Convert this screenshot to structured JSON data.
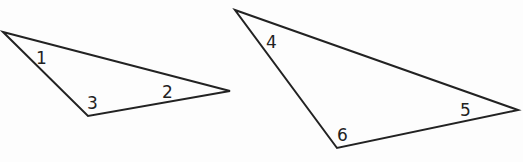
{
  "diagram": {
    "stroke_color": "#222222",
    "triangles": [
      {
        "name": "triangle-left",
        "points": [
          [
            3,
            32
          ],
          [
            230,
            91
          ],
          [
            88,
            116
          ]
        ],
        "angles": [
          {
            "label": "1",
            "x": 36,
            "y": 64
          },
          {
            "label": "2",
            "x": 162,
            "y": 98
          },
          {
            "label": "3",
            "x": 87,
            "y": 109
          }
        ]
      },
      {
        "name": "triangle-right",
        "points": [
          [
            235,
            10
          ],
          [
            518,
            110
          ],
          [
            337,
            148
          ]
        ],
        "angles": [
          {
            "label": "4",
            "x": 266,
            "y": 48
          },
          {
            "label": "5",
            "x": 460,
            "y": 116
          },
          {
            "label": "6",
            "x": 337,
            "y": 141
          }
        ]
      }
    ]
  }
}
